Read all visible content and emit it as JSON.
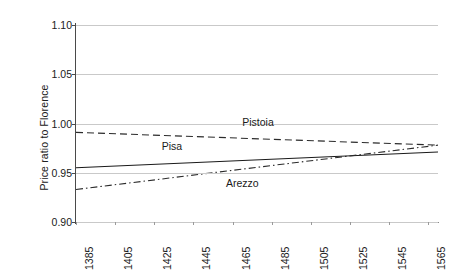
{
  "chart_data": {
    "type": "line",
    "title": "",
    "subtitle": "",
    "xlabel": "",
    "ylabel": "Price ratio to Florence",
    "xlim": [
      1385,
      1570
    ],
    "ylim": [
      0.9,
      1.1
    ],
    "yticks": [
      "1.10",
      "1.05",
      "1.00",
      "0.95",
      "0.90"
    ],
    "ytick_values": [
      1.1,
      1.05,
      1.0,
      0.95,
      0.9
    ],
    "xticks": [
      "1385",
      "1405",
      "1425",
      "1445",
      "1465",
      "1485",
      "1505",
      "1525",
      "1545",
      "1565"
    ],
    "xtick_values": [
      1385,
      1405,
      1425,
      1445,
      1465,
      1485,
      1505,
      1525,
      1545,
      1565
    ],
    "grid": true,
    "grid_axis": "y",
    "legend": "inline-annotations",
    "legend_position": "on-plot",
    "x": [
      1385,
      1570
    ],
    "series": [
      {
        "name": "Pistoia",
        "style": "dashed",
        "color": "#2b2b2b",
        "x": [
          1385,
          1570
        ],
        "values": [
          0.991,
          0.978
        ],
        "label_x": 1478,
        "label_y": 1.002
      },
      {
        "name": "Pisa",
        "style": "solid",
        "color": "#1a1a1a",
        "x": [
          1385,
          1570
        ],
        "values": [
          0.955,
          0.971
        ],
        "label_x": 1434,
        "label_y": 0.9775
      },
      {
        "name": "Arezzo",
        "style": "dash-dot",
        "color": "#2b2b2b",
        "x": [
          1385,
          1570
        ],
        "values": [
          0.933,
          0.978
        ],
        "label_x": 1470,
        "label_y": 0.9395
      }
    ],
    "annotations": [
      "Pistoia",
      "Pisa",
      "Arezzo"
    ],
    "colors": {
      "axis": "#4a4a4a",
      "grid": "#c9c9c9",
      "text": "#1a1a1a",
      "background": "#ffffff"
    }
  }
}
